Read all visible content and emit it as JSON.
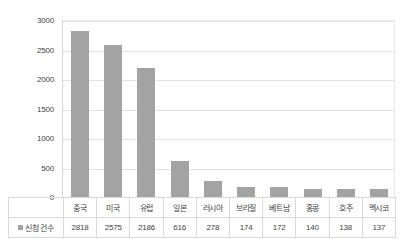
{
  "chart_data": {
    "type": "bar",
    "title": "",
    "xlabel": "",
    "ylabel": "",
    "categories": [
      "중국",
      "미국",
      "유럽",
      "일본",
      "러시아",
      "브라질",
      "베트남",
      "홍콩",
      "호주",
      "멕시코"
    ],
    "series": [
      {
        "name": "신청 건수",
        "values": [
          2818,
          2575,
          2186,
          616,
          278,
          174,
          172,
          140,
          138,
          137
        ]
      }
    ],
    "values": [
      2818,
      2575,
      2186,
      616,
      278,
      174,
      172,
      140,
      138,
      137
    ],
    "value_labels": [
      "2818",
      "2575",
      "2186",
      "616",
      "278",
      "174",
      "172",
      "140",
      "138",
      "137"
    ],
    "ylim": [
      0,
      3000
    ],
    "yticks": [
      3000,
      2500,
      2000,
      1500,
      1000,
      500,
      0
    ],
    "ytick_labels": [
      "3000",
      "2500",
      "2000",
      "1500",
      "1000",
      "500",
      "0"
    ],
    "grid": true,
    "legend_position": "bottom-left-table",
    "bar_color": "#a3a3a3",
    "gridline_color": "#e2e2e2"
  },
  "legend": {
    "label": "신청 건수",
    "swatch_name": "series-color-swatch"
  }
}
